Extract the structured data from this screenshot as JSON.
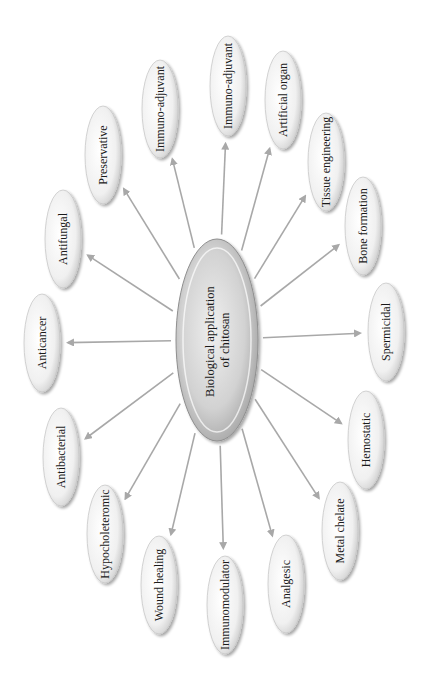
{
  "diagram": {
    "center": {
      "label_line1": "Biological application",
      "label_line2": "of chitosan",
      "cx": 217,
      "cy": 340,
      "rx": 40,
      "ry": 100
    },
    "nodes": [
      {
        "label": "Immuno-adjuvant",
        "cx": 228,
        "cy": 86,
        "rx": 18,
        "ry": 50
      },
      {
        "label": "Artificial organ",
        "cx": 283,
        "cy": 100,
        "rx": 18,
        "ry": 49
      },
      {
        "label": "Tissue engineering",
        "cx": 326,
        "cy": 162,
        "rx": 18,
        "ry": 49
      },
      {
        "label": "Bone formation",
        "cx": 363,
        "cy": 226,
        "rx": 18,
        "ry": 49
      },
      {
        "label": "Spermicidal",
        "cx": 386,
        "cy": 332,
        "rx": 18,
        "ry": 49
      },
      {
        "label": "Hemostatic",
        "cx": 366,
        "cy": 440,
        "rx": 18,
        "ry": 49
      },
      {
        "label": "Metal chelate",
        "cx": 340,
        "cy": 531,
        "rx": 18,
        "ry": 49
      },
      {
        "label": "Analgesic",
        "cx": 286,
        "cy": 584,
        "rx": 18,
        "ry": 49
      },
      {
        "label": "Immunomodulator",
        "cx": 225,
        "cy": 605,
        "rx": 18,
        "ry": 49
      },
      {
        "label": "Wound healing",
        "cx": 159,
        "cy": 585,
        "rx": 18,
        "ry": 49
      },
      {
        "label": "Hypocholeteromic",
        "cx": 105,
        "cy": 534,
        "rx": 18,
        "ry": 49
      },
      {
        "label": "Antibacterial",
        "cx": 61,
        "cy": 457,
        "rx": 18,
        "ry": 49
      },
      {
        "label": "Anticancer",
        "cx": 42,
        "cy": 343,
        "rx": 18,
        "ry": 49
      },
      {
        "label": "Antifungal",
        "cx": 63,
        "cy": 239,
        "rx": 18,
        "ry": 49
      },
      {
        "label": "Preservative",
        "cx": 103,
        "cy": 155,
        "rx": 18,
        "ry": 49
      },
      {
        "label": "Immuno-adjuvant",
        "cx": 160,
        "cy": 109,
        "rx": 18,
        "ry": 49
      }
    ],
    "arrow_color": "#a8a8a8",
    "node_fill": "#f2f2f2",
    "node_edge": "#c8c8c8",
    "center_fill": "#bdbdbd"
  }
}
